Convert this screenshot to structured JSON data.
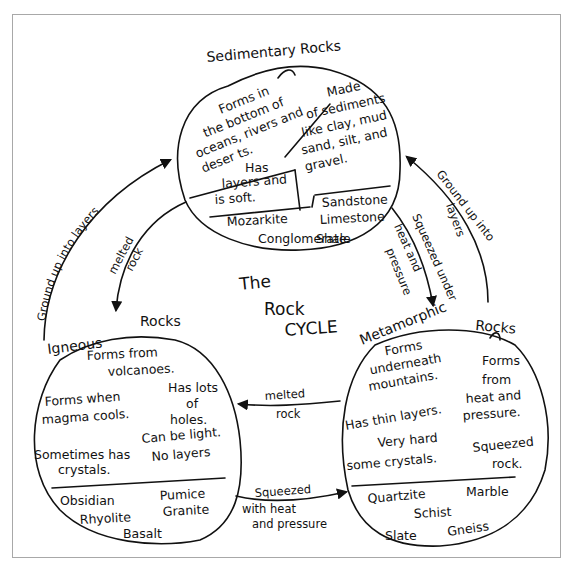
{
  "diagram": {
    "title": [
      "The",
      "Rock",
      "CYCLE"
    ],
    "colors": {
      "ink": "#111111",
      "background": "#ffffff",
      "frame": "#a8a8a8"
    },
    "nodes": {
      "sedimentary": {
        "heading": "Sedimentary Rocks",
        "facts": {
          "formation": [
            "Forms in",
            "the bottom of",
            "oceans, rivers and",
            "deser ts."
          ],
          "composition": [
            "Made",
            "of sediments",
            "like clay, mud",
            "sand, silt, and",
            "gravel."
          ],
          "texture": [
            "Has",
            "layers and",
            "is soft."
          ]
        },
        "examples": [
          "Sandstone",
          "Limestone",
          "Shale",
          "Mozarkite",
          "Conglomerate"
        ]
      },
      "igneous": {
        "heading_word1": "Igneous",
        "heading_word2": "Rocks",
        "facts": {
          "formation": [
            "Forms from",
            "volcanoes."
          ],
          "cooling": [
            "Forms when",
            "magma cools."
          ],
          "holes": [
            "Has lots",
            "of",
            "holes."
          ],
          "weight": [
            "Can be light.",
            "No layers"
          ],
          "crystals": [
            "Sometimes has",
            "crystals."
          ]
        },
        "examples": [
          "Obsidian",
          "Pumice",
          "Rhyolite",
          "Granite",
          "Basalt"
        ]
      },
      "metamorphic": {
        "heading_word1": "Metamorphic",
        "heading_word2": "Rocks",
        "facts": {
          "location": [
            "Forms",
            "underneath",
            "mountains."
          ],
          "formation": [
            "Forms",
            "from",
            "heat and",
            "pressure."
          ],
          "layers": "Has thin layers.",
          "hardness": [
            "Very hard",
            "some crystals."
          ],
          "squeezed": [
            "Squeezed",
            "rock."
          ]
        },
        "examples": [
          "Quartzite",
          "Marble",
          "Schist",
          "Slate",
          "Gneiss"
        ]
      }
    },
    "edges": [
      {
        "from": "igneous",
        "to": "sedimentary",
        "label": "Ground up into layers"
      },
      {
        "from": "sedimentary",
        "to": "igneous",
        "label": [
          "melted",
          "rock"
        ]
      },
      {
        "from": "sedimentary",
        "to": "metamorphic",
        "label": [
          "Squeezed under",
          "heat and",
          "pressure"
        ]
      },
      {
        "from": "metamorphic",
        "to": "sedimentary",
        "label": [
          "Ground up into",
          "layers"
        ]
      },
      {
        "from": "metamorphic",
        "to": "igneous",
        "label": [
          "melted",
          "rock"
        ]
      },
      {
        "from": "igneous",
        "to": "metamorphic",
        "label": [
          "Squeezed",
          "with heat",
          "and pressure"
        ]
      }
    ]
  }
}
